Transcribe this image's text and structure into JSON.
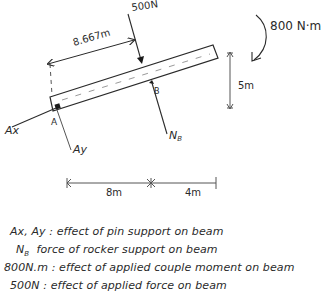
{
  "diagram": {
    "type": "free-body diagram",
    "beam": {
      "label": "beam",
      "supports": [
        "A",
        "B"
      ]
    },
    "forces": {
      "applied_force": {
        "label": "500N"
      },
      "couple_moment": {
        "label": "800 N·m"
      },
      "pin_x": {
        "label": "Ax"
      },
      "pin_y": {
        "label": "Ay"
      },
      "rocker_normal": {
        "label": "N",
        "subscript": "B"
      }
    },
    "points": {
      "a": "A",
      "b": "B"
    },
    "dimensions": {
      "slant_distance": "8.667m",
      "height": "5m",
      "horizontal_left": "8m",
      "horizontal_right": "4m"
    }
  },
  "legend": [
    {
      "symbol": "Ax, Ay",
      "separator": ":",
      "description": "effect of pin support on beam"
    },
    {
      "symbol": "N",
      "symbol_sub": "B",
      "separator": "",
      "description": "force of rocker support on beam"
    },
    {
      "symbol": "800N.m",
      "separator": ":",
      "description": "effect of applied couple moment on beam"
    },
    {
      "symbol": "500N",
      "separator": ":",
      "description": "effect of applied force on beam"
    }
  ],
  "colors": {
    "ink": "#2a2a2a",
    "paper": "#ffffff",
    "dim_line": "#555555"
  }
}
